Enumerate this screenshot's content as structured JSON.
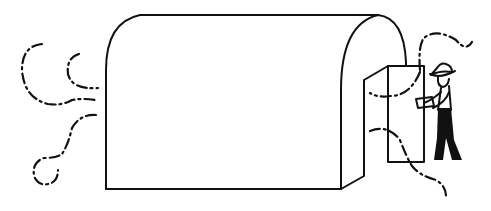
{
  "illustration": {
    "subject": "Quonset-style hut with open door and a cowboy figure holding a paper",
    "colors": {
      "background": "#ffffff",
      "ink": "#111111"
    },
    "elements": [
      "hut-body",
      "hut-arched-roof",
      "hut-front-opening",
      "open-door",
      "cowboy-figure",
      "dashed-wind-trails"
    ]
  }
}
